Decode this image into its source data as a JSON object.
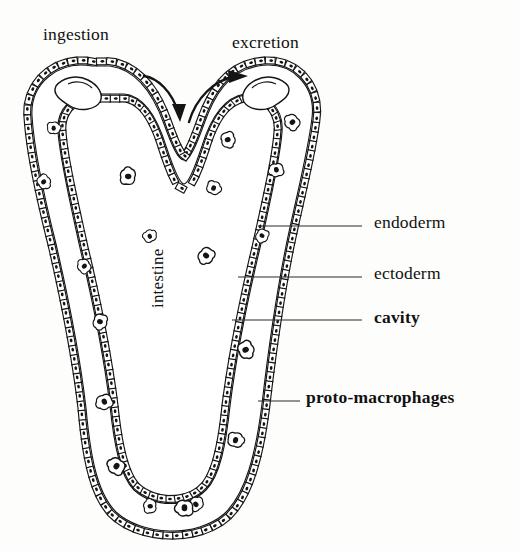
{
  "figure": {
    "kind": "biological-schematic",
    "ink_color": "#141414",
    "background_color": "#fdfdfc"
  },
  "process_labels": [
    {
      "id": "ingestion",
      "text": "ingestion"
    },
    {
      "id": "excretion",
      "text": "excretion"
    }
  ],
  "structure_labels": [
    {
      "id": "endoderm",
      "text": "endoderm"
    },
    {
      "id": "ectoderm",
      "text": "ectoderm"
    },
    {
      "id": "cavity",
      "text": "cavity"
    },
    {
      "id": "proto",
      "text": "proto-macrophages"
    }
  ],
  "internal_labels": [
    {
      "id": "intestine",
      "text": "intestine",
      "rotation_deg": -90
    }
  ],
  "arrows": [
    {
      "id": "ingestion-arrow",
      "direction": "down-right-into-mouth"
    },
    {
      "id": "excretion-arrow",
      "direction": "up-right-out-of-anus"
    }
  ],
  "leader_lines": [
    {
      "target": "endoderm",
      "from_x": 258,
      "to_x": 362,
      "y": 226
    },
    {
      "target": "ectoderm",
      "from_x": 238,
      "to_x": 362,
      "y": 277
    },
    {
      "target": "cavity",
      "from_x": 232,
      "to_x": 362,
      "y": 320
    },
    {
      "target": "proto",
      "from_x": 258,
      "to_x": 300,
      "y": 401
    }
  ]
}
